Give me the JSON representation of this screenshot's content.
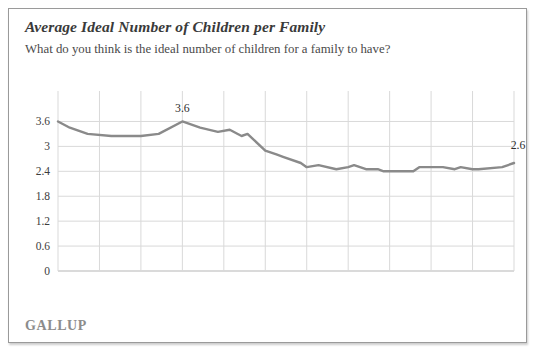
{
  "card": {
    "title": "Average Ideal Number of Children per Family",
    "subtitle": "What do you think is the ideal number of children for a family to have?",
    "source_logo": "GALLUP"
  },
  "colors": {
    "line": "#8a8a8a",
    "grid": "#d9d9d9",
    "axis": "#b5b5b5",
    "text": "#3d3d3d",
    "border": "#9a9a9a",
    "background": "#ffffff"
  },
  "chart_data": {
    "type": "line",
    "title": "Average Ideal Number of Children per Family",
    "subtitle": "What do you think is the ideal number of children for a family to have?",
    "xlabel": "",
    "ylabel": "",
    "xlim": [
      1936,
      2013
    ],
    "ylim": [
      0,
      3.9
    ],
    "grid": true,
    "legend": "none",
    "ytick_labels": [
      "0",
      "0.6",
      "1.2",
      "1.8",
      "2.4",
      "3",
      "3.6"
    ],
    "ytick_values": [
      0,
      0.6,
      1.2,
      1.8,
      2.4,
      3,
      3.6
    ],
    "xtick_labels": [
      "1936",
      "1943",
      "1950",
      "1957",
      "1964",
      "1971",
      "1978",
      "1985",
      "1992",
      "1999",
      "2006",
      "2013"
    ],
    "xtick_values": [
      1936,
      1943,
      1950,
      1957,
      1964,
      1971,
      1978,
      1985,
      1992,
      1999,
      2006,
      2013
    ],
    "annotations": [
      {
        "label": "3.6",
        "x": 1957,
        "y": 3.6,
        "position": "above"
      },
      {
        "label": "2.6",
        "x": 2013,
        "y": 2.6,
        "position": "above-right"
      }
    ],
    "series": [
      {
        "name": "Average ideal number of children",
        "color": "#8a8a8a",
        "x": [
          1936,
          1938,
          1941,
          1945,
          1947,
          1950,
          1953,
          1957,
          1960,
          1963,
          1965,
          1967,
          1968,
          1971,
          1973,
          1974,
          1977,
          1978,
          1980,
          1983,
          1985,
          1986,
          1988,
          1990,
          1991,
          1993,
          1996,
          1997,
          1999,
          2001,
          2003,
          2004,
          2006,
          2007,
          2011,
          2013
        ],
        "y": [
          3.6,
          3.45,
          3.3,
          3.25,
          3.25,
          3.25,
          3.3,
          3.6,
          3.45,
          3.35,
          3.4,
          3.25,
          3.3,
          2.9,
          2.8,
          2.75,
          2.6,
          2.5,
          2.55,
          2.45,
          2.5,
          2.55,
          2.45,
          2.45,
          2.4,
          2.4,
          2.4,
          2.5,
          2.5,
          2.5,
          2.45,
          2.5,
          2.45,
          2.45,
          2.5,
          2.6
        ]
      }
    ]
  },
  "layout": {
    "plot_left": 49,
    "plot_right": 505,
    "plot_top": 42,
    "plot_bottom": 204
  }
}
